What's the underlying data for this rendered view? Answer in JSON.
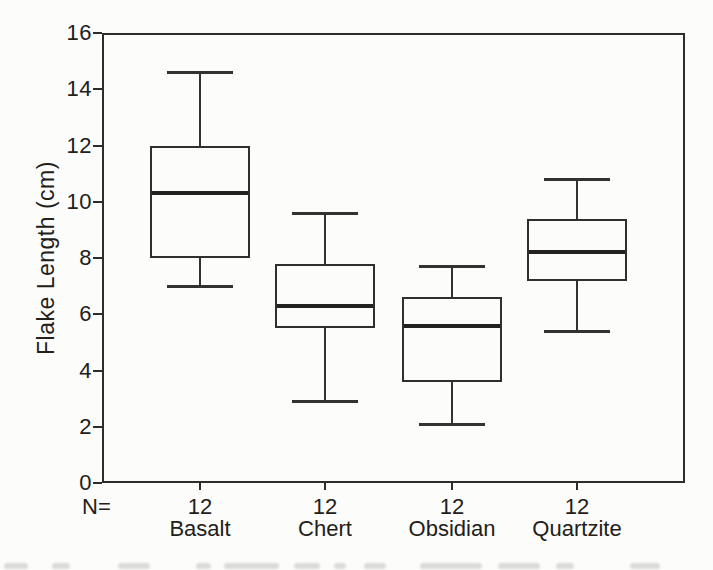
{
  "figure": {
    "kind": "scanned-boxplot-figure"
  },
  "chart_data": {
    "type": "boxplot",
    "title": "",
    "xlabel": "",
    "ylabel": "Flake Length (cm)",
    "ylim": [
      0,
      16
    ],
    "yticks": [
      0,
      2,
      4,
      6,
      8,
      10,
      12,
      14,
      16
    ],
    "grid": false,
    "legend": "none",
    "categories": [
      "Basalt",
      "Chert",
      "Obsidian",
      "Quartzite"
    ],
    "n_label": "N=",
    "n_values": [
      12,
      12,
      12,
      12
    ],
    "series": [
      {
        "name": "Basalt",
        "n": 12,
        "min": 7.0,
        "q1": 8.0,
        "median": 10.3,
        "q3": 12.0,
        "max": 14.6
      },
      {
        "name": "Chert",
        "n": 12,
        "min": 2.9,
        "q1": 5.5,
        "median": 6.3,
        "q3": 7.8,
        "max": 9.6
      },
      {
        "name": "Obsidian",
        "n": 12,
        "min": 2.1,
        "q1": 3.6,
        "median": 5.6,
        "q3": 6.6,
        "max": 7.7
      },
      {
        "name": "Quartzite",
        "n": 12,
        "min": 5.4,
        "q1": 7.2,
        "median": 8.2,
        "q3": 9.4,
        "max": 10.8
      }
    ]
  },
  "colors": {
    "line": "#2f2d2a",
    "median_line": "#242220",
    "text": "#222019",
    "background": "#fcfcfb",
    "box_fill": "#fcfcfb"
  }
}
